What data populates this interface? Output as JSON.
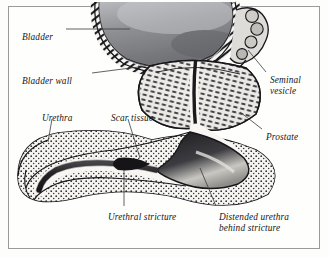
{
  "figure": {
    "style": "engraved medical illustration, grayscale halftone",
    "background_color": "#fdfdfc",
    "frame_color": "#9a9a98",
    "ink_color": "#16161a"
  },
  "labels": [
    {
      "id": "bladder",
      "text": "Bladder",
      "x": 22,
      "y": 32,
      "leader": true
    },
    {
      "id": "bladder-wall",
      "text": "Bladder wall",
      "x": 22,
      "y": 76,
      "leader": true
    },
    {
      "id": "urethra",
      "text": "Urethra",
      "x": 42,
      "y": 113,
      "leader": true
    },
    {
      "id": "scar-tissue",
      "text": "Scar tissue",
      "x": 111,
      "y": 113,
      "leader": true
    },
    {
      "id": "seminal-vesicle",
      "text": "Seminal",
      "text2": "vesicle",
      "x": 270,
      "y": 75,
      "leader": true
    },
    {
      "id": "prostate",
      "text": "Prostate",
      "x": 266,
      "y": 132,
      "leader": true
    },
    {
      "id": "urethral-stricture",
      "text": "Urethral stricture",
      "x": 108,
      "y": 212,
      "leader": true
    },
    {
      "id": "distended-urethra",
      "text": "Distended urethra",
      "text2": "behind stricture",
      "x": 219,
      "y": 212,
      "leader": true
    }
  ],
  "anatomy": {
    "bladder": {
      "name": "Bladder",
      "fill": "#8f9094",
      "wall_texture": "scalloped hatched band"
    },
    "bladder_wall": {
      "name": "Bladder wall",
      "fill": "#f2f1ee"
    },
    "prostate": {
      "name": "Prostate",
      "fill": "#e8e7e3",
      "texture": "lobed glandular striations"
    },
    "seminal_vesicle": {
      "name": "Seminal vesicle",
      "fill": "#d9d8d4",
      "texture": "beaded coil"
    },
    "urethra": {
      "name": "Urethra",
      "lumen_fill": "#2e2e31",
      "wall_fill": "#f4f3f0",
      "texture": "stippled corpus spongiosum"
    },
    "scar_tissue": {
      "name": "Scar tissue",
      "fill": "#1b1b1e"
    },
    "urethral_stricture": {
      "name": "Urethral stricture",
      "description": "narrowed lumen segment"
    },
    "distended_urethra": {
      "name": "Distended urethra behind stricture",
      "fill": "#3a3a3d",
      "highlight": "#cfcdc8"
    }
  }
}
